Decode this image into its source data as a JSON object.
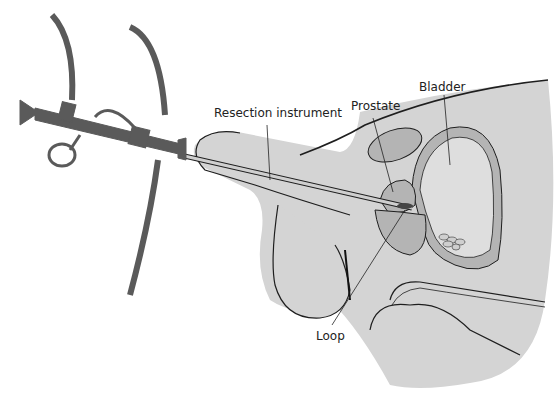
{
  "diagram": {
    "labels": {
      "resection_instrument": "Resection instrument",
      "prostate": "Prostate",
      "bladder": "Bladder",
      "loop": "Loop"
    },
    "colors": {
      "body": "#d4d4d4",
      "organ": "#b4b4b4",
      "instrument": "#5a5a5a",
      "outline": "#1e1e1e",
      "loop_tip": "#444444"
    }
  }
}
